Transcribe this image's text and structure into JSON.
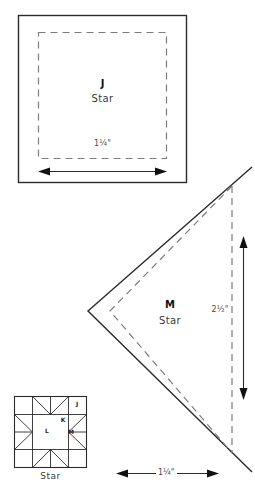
{
  "document": {
    "kind": "quilt-template-sheet",
    "background_color": "#ffffff",
    "line_color": "#2b2b2b",
    "dashed_color": "#7d7d7d"
  },
  "templates": [
    {
      "id": "J",
      "piece_letter": "J",
      "block_name": "Star",
      "shape": "square",
      "finished_size": "1¼\"",
      "dimension_label": "1¼\"",
      "arrow": "double-horizontal"
    },
    {
      "id": "M",
      "piece_letter": "M",
      "block_name": "Star",
      "shape": "half-square-triangle",
      "finished_size": "2½\"",
      "dimension_label": "2½\"",
      "arrow": "double-vertical",
      "base_dimension_label": "1¼\"",
      "base_arrow": "double-horizontal"
    }
  ],
  "block_diagram": {
    "name": "Star",
    "caption": "Star",
    "piece_labels": [
      {
        "letter": "J",
        "position": "top-right-corner-square"
      },
      {
        "letter": "K",
        "position": "right-upper-triangle"
      },
      {
        "letter": "L",
        "position": "center-square"
      },
      {
        "letter": "M",
        "position": "right-middle-triangle"
      }
    ]
  }
}
